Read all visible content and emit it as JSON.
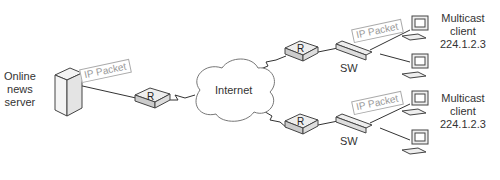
{
  "diagram": {
    "server": {
      "label_lines": [
        "Online",
        "news",
        "server"
      ]
    },
    "internet": {
      "label": "Internet"
    },
    "router_label": "R",
    "switch_label": "SW",
    "packet_label": "IP Packet",
    "branches": [
      {
        "client_label_lines": [
          "Multicast",
          "client",
          "224.1.2.3"
        ]
      },
      {
        "client_label_lines": [
          "Multicast",
          "client",
          "224.1.2.3"
        ]
      }
    ]
  },
  "colors": {
    "line": "#333333",
    "device_fill": "#f2f2f2",
    "packet_text": "#999999"
  }
}
